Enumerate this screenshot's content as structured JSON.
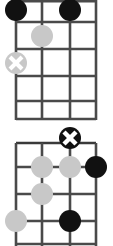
{
  "page": {
    "background_color": "#ffffff",
    "width": 113,
    "height": 246
  },
  "colors": {
    "grid_line": "#4a4a4a",
    "nut_line": "#3a3a3a",
    "marker_filled": "#111111",
    "marker_muted": "#c8c8c8",
    "marker_x_stroke": "#ffffff",
    "background": "#ffffff"
  },
  "geometry": {
    "string_x": [
      16,
      42,
      70,
      96
    ],
    "fret_y_top": [
      -2,
      22,
      49,
      76,
      101,
      119
    ],
    "fret_y_bottom": [
      20,
      44,
      71,
      98,
      121
    ],
    "marker_radius": 11,
    "marker_radius_small": 10
  },
  "diagrams": [
    {
      "name": "chord-diagram-top",
      "label": "Chord diagram 1",
      "strings": 4,
      "frets": 5,
      "markers": [
        {
          "name": "marker-filled-s1-f1",
          "string": 1,
          "fret": 1,
          "style": "filled",
          "symbol": "dot"
        },
        {
          "name": "marker-filled-s3-f1",
          "string": 3,
          "fret": 1,
          "style": "filled",
          "symbol": "dot"
        },
        {
          "name": "marker-muted-s2-f2",
          "string": 2,
          "fret": 2,
          "style": "muted",
          "symbol": "dot"
        },
        {
          "name": "marker-muted-x-s1-f3",
          "string": 1,
          "fret": 3,
          "style": "muted",
          "symbol": "x"
        }
      ]
    },
    {
      "name": "chord-diagram-bottom",
      "label": "Chord diagram 2",
      "strings": 4,
      "frets": 4,
      "markers": [
        {
          "name": "marker-open-x-s3-nut",
          "string": 3,
          "fret": 0,
          "style": "filled",
          "symbol": "x"
        },
        {
          "name": "marker-muted-s2-f1",
          "string": 2,
          "fret": 1,
          "style": "muted",
          "symbol": "dot"
        },
        {
          "name": "marker-muted-s3-f1",
          "string": 3,
          "fret": 1,
          "style": "muted",
          "symbol": "dot"
        },
        {
          "name": "marker-filled-s4-f1",
          "string": 4,
          "fret": 1,
          "style": "filled",
          "symbol": "dot"
        },
        {
          "name": "marker-muted-s2-f2",
          "string": 2,
          "fret": 2,
          "style": "muted",
          "symbol": "dot"
        },
        {
          "name": "marker-muted-s1-f3",
          "string": 1,
          "fret": 3,
          "style": "muted",
          "symbol": "dot"
        },
        {
          "name": "marker-filled-s3-f3",
          "string": 3,
          "fret": 3,
          "style": "filled",
          "symbol": "dot"
        }
      ]
    }
  ]
}
